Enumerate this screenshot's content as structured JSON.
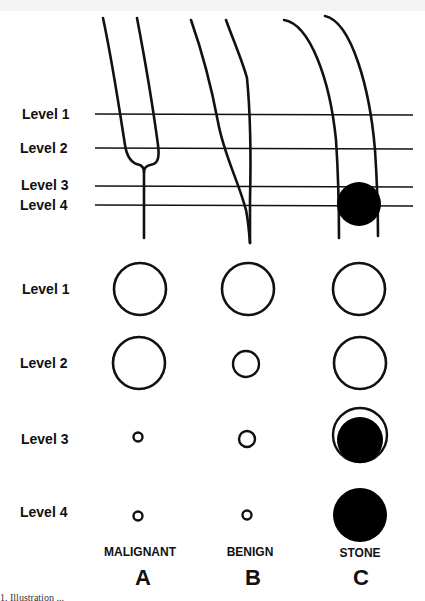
{
  "figure": {
    "top_diagram": {
      "level_labels": [
        "Level 1",
        "Level 2",
        "Level 3",
        "Level 4"
      ]
    },
    "cross_sections": {
      "level_labels": [
        "Level 1",
        "Level 2",
        "Level 3",
        "Level 4"
      ],
      "columns": [
        {
          "category": "MALIGNANT",
          "letter": "A",
          "circles": [
            "large-open",
            "large-open",
            "tiny-open",
            "tiny-open"
          ]
        },
        {
          "category": "BENIGN",
          "letter": "B",
          "circles": [
            "large-open",
            "small-open",
            "small-open",
            "tiny-open"
          ]
        },
        {
          "category": "STONE",
          "letter": "C",
          "circles": [
            "large-open",
            "large-open",
            "filled-with-crescent",
            "large-filled"
          ]
        }
      ]
    },
    "caption_fragment": "1. Illustration ..."
  }
}
